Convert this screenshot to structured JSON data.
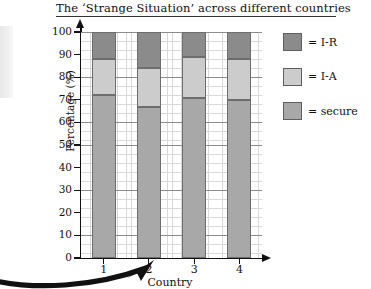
{
  "chart_data": {
    "type": "bar",
    "title": "The ‘Strange Situation’ across different countries",
    "xlabel": "Country",
    "ylabel": "Percentage (%)",
    "categories": [
      "1",
      "2",
      "3",
      "4"
    ],
    "ylim": [
      0,
      100
    ],
    "ytick_labels": [
      "100",
      "90",
      "80",
      "70",
      "60",
      "50",
      "40",
      "30",
      "20",
      "10",
      "0"
    ],
    "ytick_values": [
      100,
      90,
      80,
      70,
      60,
      50,
      40,
      30,
      20,
      10,
      0
    ],
    "stacked": true,
    "grid": true,
    "grid_style": "graph-paper",
    "legend_position": "right",
    "series": [
      {
        "name": "secure",
        "color": "#a8a8a8",
        "values": [
          72,
          67,
          71,
          70
        ]
      },
      {
        "name": "I-A",
        "color": "#cccccc",
        "values": [
          16,
          17,
          18,
          18
        ]
      },
      {
        "name": "I-R",
        "color": "#8b8b8b",
        "values": [
          12,
          16,
          11,
          12
        ]
      }
    ],
    "cumulative_tops": {
      "secure": [
        72,
        67,
        71,
        70
      ],
      "I-A": [
        88,
        84,
        89,
        88
      ],
      "I-R": [
        100,
        100,
        100,
        100
      ]
    },
    "annotation": {
      "type": "curved-arrow",
      "description": "thick black curved arrow sweeping from left edge pointing up-right toward country 2"
    }
  },
  "legend": {
    "items": [
      {
        "label": "= I-R",
        "key": "ir"
      },
      {
        "label": "= I-A",
        "key": "ia"
      },
      {
        "label": "= secure",
        "key": "secure"
      }
    ]
  }
}
